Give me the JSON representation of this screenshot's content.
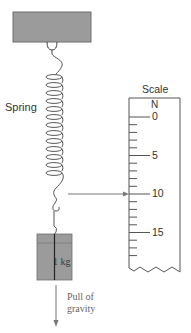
{
  "diagram": {
    "type": "spring-scale-physics",
    "labels": {
      "spring": "Spring",
      "scale": "Scale",
      "unit": "N",
      "mass": "1 kg",
      "gravity_line1": "Pull of",
      "gravity_line2": "gravity"
    },
    "scale": {
      "tick_labels": [
        "0",
        "5",
        "10",
        "15"
      ],
      "major_ticks": [
        0,
        5,
        10,
        15
      ],
      "minor_tick_step": 1,
      "reading": 10
    },
    "colors": {
      "block_fill": "#9b9b9b",
      "line": "#555555",
      "arrow": "#777777",
      "text": "#333333"
    }
  }
}
